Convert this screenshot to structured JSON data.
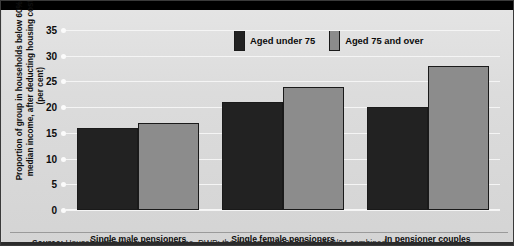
{
  "chart_data": {
    "type": "bar",
    "title": "",
    "xlabel": "",
    "ylabel": "Proportion of group in households below 60% of median income, after deducting housing costs (per cent)",
    "ylim": [
      0,
      35
    ],
    "ytick_step": 5,
    "yticks": [
      "35",
      "30",
      "25",
      "20",
      "15",
      "10",
      "5",
      "0"
    ],
    "grid": true,
    "legend_position": "top-center",
    "categories": [
      "Single male pensioners",
      "Single female pensioners",
      "In pensioner couples"
    ],
    "series": [
      {
        "name": "Aged under 75",
        "color": "#222222",
        "values": [
          16,
          21,
          20
        ]
      },
      {
        "name": "Aged 75 and over",
        "color": "#8c8c8c",
        "values": [
          17,
          24,
          28
        ]
      }
    ]
  },
  "legend": {
    "items": [
      {
        "label": "Aged under 75",
        "color": "#222222"
      },
      {
        "label": "Aged 75 and over",
        "color": "#8c8c8c"
      }
    ]
  },
  "footer": {
    "source_label": "Source:",
    "source_text": "Household Below Average Income, DWP; the data is for 2001/02 to 2003/04 combined"
  }
}
